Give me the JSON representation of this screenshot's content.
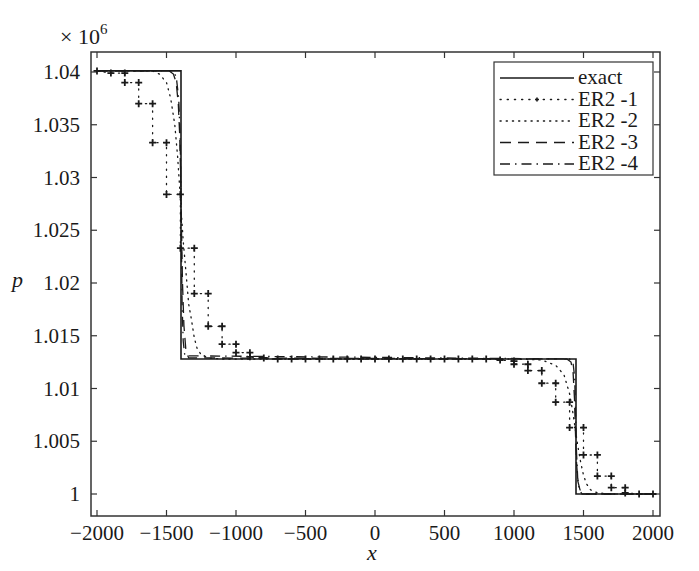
{
  "chart_data": {
    "type": "line",
    "title": "",
    "xlabel": "x",
    "ylabel": "p",
    "y_scale_note": "× 10^6",
    "y_multiplier_base": "× 10",
    "y_multiplier_exp": "6",
    "xlim": [
      -2000,
      2000
    ],
    "ylim": [
      0.9997,
      1.0419
    ],
    "grid": false,
    "legend_position": "upper right",
    "x_ticks": [
      -2000,
      -1500,
      -1000,
      -500,
      0,
      500,
      1000,
      1500,
      2000
    ],
    "x_tick_labels": [
      "−2000",
      "−1500",
      "−1000",
      "−500",
      "0",
      "500",
      "1000",
      "1500",
      "2000"
    ],
    "y_ticks": [
      1.0,
      1.005,
      1.01,
      1.015,
      1.02,
      1.025,
      1.03,
      1.035,
      1.04
    ],
    "y_tick_labels": [
      "1",
      "1.005",
      "1.01",
      "1.015",
      "1.02",
      "1.025",
      "1.03",
      "1.035",
      "1.04"
    ],
    "series": [
      {
        "name": "exact",
        "style": "solid",
        "x": [
          -2000,
          -1396,
          -1396,
          1446,
          1446,
          2000
        ],
        "y": [
          1.0401,
          1.0401,
          1.0128,
          1.0128,
          1.0,
          1.0
        ]
      },
      {
        "name": "ER2 -1",
        "style": "dotted-plus-markers",
        "x": [
          -2000,
          -1900,
          -1800,
          -1800,
          -1700,
          -1700,
          -1600,
          -1600,
          -1500,
          -1500,
          -1400,
          -1400,
          -1300,
          -1300,
          -1200,
          -1200,
          -1100,
          -1100,
          -1000,
          -1000,
          -900,
          -900,
          -800,
          -700,
          -600,
          -500,
          -400,
          -300,
          -200,
          -100,
          0,
          100,
          200,
          300,
          400,
          500,
          600,
          700,
          800,
          900,
          1000,
          1000,
          1100,
          1100,
          1200,
          1200,
          1300,
          1300,
          1400,
          1400,
          1500,
          1500,
          1600,
          1600,
          1700,
          1700,
          1800,
          1800,
          1900,
          2000
        ],
        "y": [
          1.0401,
          1.0399,
          1.0399,
          1.039,
          1.039,
          1.037,
          1.037,
          1.0333,
          1.0333,
          1.0284,
          1.0284,
          1.0233,
          1.0233,
          1.019,
          1.019,
          1.0159,
          1.0159,
          1.0142,
          1.0142,
          1.0134,
          1.0134,
          1.013,
          1.0129,
          1.0128,
          1.0128,
          1.0128,
          1.0128,
          1.0128,
          1.0128,
          1.0128,
          1.0128,
          1.0128,
          1.0128,
          1.0128,
          1.0128,
          1.0128,
          1.0128,
          1.0128,
          1.0128,
          1.0127,
          1.0126,
          1.0123,
          1.0123,
          1.0117,
          1.0117,
          1.0105,
          1.0105,
          1.0087,
          1.0087,
          1.0063,
          1.0063,
          1.0037,
          1.0037,
          1.0017,
          1.0017,
          1.0006,
          1.0006,
          1.0001,
          1.0,
          1.0
        ]
      },
      {
        "name": "ER2 -2",
        "style": "dotted",
        "x": [
          -2000,
          -1600,
          -1550,
          -1500,
          -1470,
          -1440,
          -1420,
          -1400,
          -1390,
          -1380,
          -1360,
          -1340,
          -1320,
          -1300,
          -1280,
          -1250,
          -1200,
          -1100,
          1000,
          1200,
          1300,
          1360,
          1400,
          1420,
          1440,
          1460,
          1480,
          1500,
          1520,
          1550,
          1600,
          1700,
          2000
        ],
        "y": [
          1.0401,
          1.0401,
          1.0398,
          1.039,
          1.0375,
          1.035,
          1.032,
          1.028,
          1.026,
          1.024,
          1.021,
          1.018,
          1.0165,
          1.0148,
          1.0138,
          1.0132,
          1.0129,
          1.0128,
          1.0128,
          1.0127,
          1.0122,
          1.0113,
          1.0095,
          1.008,
          1.0062,
          1.0045,
          1.003,
          1.0018,
          1.001,
          1.0004,
          1.0001,
          1.0,
          1.0
        ]
      },
      {
        "name": "ER2 -3",
        "style": "dashed",
        "x": [
          -2000,
          -1480,
          -1450,
          -1430,
          -1415,
          -1405,
          -1398,
          -1392,
          -1385,
          -1375,
          -1360,
          -1340,
          1380,
          1410,
          1425,
          1435,
          1442,
          1450,
          1460,
          1475,
          1500,
          2000
        ],
        "y": [
          1.0401,
          1.0401,
          1.0398,
          1.039,
          1.037,
          1.034,
          1.03,
          1.025,
          1.02,
          1.016,
          1.0135,
          1.0129,
          1.0128,
          1.0125,
          1.0115,
          1.009,
          1.006,
          1.003,
          1.0012,
          1.0004,
          1.0,
          1.0
        ]
      },
      {
        "name": "ER2 -4",
        "style": "dashdot",
        "x": [
          -2000,
          -1460,
          -1430,
          -1412,
          -1402,
          -1397,
          -1393,
          -1388,
          -1380,
          -1368,
          1400,
          1425,
          1437,
          1443,
          1450,
          1458,
          1470,
          1490,
          2000
        ],
        "y": [
          1.0401,
          1.0401,
          1.0396,
          1.0375,
          1.034,
          1.03,
          1.024,
          1.018,
          1.0145,
          1.0131,
          1.0128,
          1.0124,
          1.011,
          1.0075,
          1.004,
          1.0015,
          1.0004,
          1.0,
          1.0
        ]
      }
    ]
  },
  "legend": {
    "items": [
      {
        "label": "exact",
        "style": "solid"
      },
      {
        "label": "ER2 -1",
        "style": "dotted-plus"
      },
      {
        "label": "ER2 -2",
        "style": "dotted"
      },
      {
        "label": "ER2 -3",
        "style": "dashed"
      },
      {
        "label": "ER2 -4",
        "style": "dashdot"
      }
    ]
  },
  "colors": {
    "line": "#1a1a1a",
    "background": "#ffffff",
    "frame": "#333333"
  }
}
